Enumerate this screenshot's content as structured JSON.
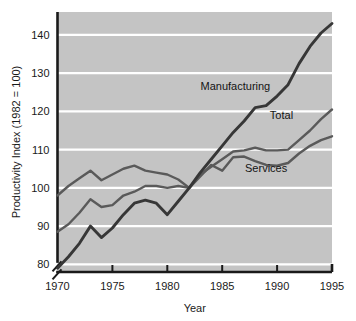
{
  "chart_data": {
    "type": "line",
    "title": "",
    "xlabel": "Year",
    "ylabel": "Productivity Index (1982 = 100)",
    "xlim": [
      1970,
      1995
    ],
    "ylim": [
      78,
      146
    ],
    "xticks": [
      "1970",
      "1975",
      "1980",
      "1985",
      "1990",
      "1995"
    ],
    "xtick_values": [
      1970,
      1975,
      1980,
      1985,
      1990,
      1995
    ],
    "yticks": [
      "80",
      "90",
      "100",
      "110",
      "120",
      "130",
      "140"
    ],
    "ytick_values": [
      80,
      90,
      100,
      110,
      120,
      130,
      140
    ],
    "grid": "horizontal-white-gridlines",
    "axis_break": "y-axis broken below 80",
    "legend": "inline labels on plot",
    "plot_background": "#c4c4c4",
    "x": [
      1970,
      1971,
      1972,
      1973,
      1974,
      1975,
      1976,
      1977,
      1978,
      1979,
      1980,
      1981,
      1982,
      1983,
      1984,
      1985,
      1986,
      1987,
      1988,
      1989,
      1990,
      1991,
      1992,
      1993,
      1994,
      1995
    ],
    "series": [
      {
        "name": "Manufacturing",
        "color": "#373737",
        "label": "Manufacturing",
        "values": [
          79.0,
          82.0,
          85.5,
          90.0,
          87.0,
          89.5,
          93.0,
          96.0,
          96.8,
          96.0,
          93.0,
          96.5,
          100.0,
          104.0,
          107.5,
          111.0,
          114.5,
          117.5,
          121.0,
          121.5,
          124.0,
          127.0,
          132.5,
          137.0,
          140.5,
          143.0
        ]
      },
      {
        "name": "Total",
        "color": "#5a5a5a",
        "label": "Total",
        "values": [
          88.5,
          90.5,
          93.5,
          97.0,
          95.0,
          95.5,
          98.0,
          99.0,
          100.5,
          100.5,
          100.0,
          100.5,
          100.0,
          103.5,
          105.5,
          107.5,
          109.5,
          109.8,
          110.5,
          109.8,
          109.8,
          110.0,
          112.5,
          115.0,
          118.0,
          120.5
        ]
      },
      {
        "name": "Services",
        "color": "#5a5a5a",
        "label": "Services",
        "values": [
          98.0,
          100.5,
          102.5,
          104.5,
          102.0,
          103.5,
          105.0,
          105.8,
          104.5,
          104.0,
          103.5,
          102.2,
          100.0,
          103.0,
          106.0,
          104.5,
          108.0,
          108.2,
          107.0,
          106.0,
          105.8,
          106.5,
          109.0,
          111.0,
          112.5,
          113.5
        ]
      }
    ],
    "label_positions": [
      {
        "name": "Manufacturing",
        "x": 1986.2,
        "y": 125.5
      },
      {
        "name": "Total",
        "x": 1990.4,
        "y": 118.0
      },
      {
        "name": "Services",
        "x": 1989.0,
        "y": 104.2
      }
    ]
  }
}
